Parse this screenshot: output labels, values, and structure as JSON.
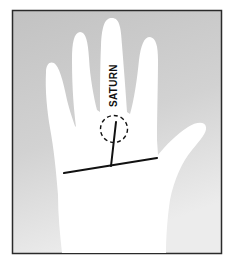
{
  "diagram": {
    "labels": [
      {
        "text": "SATURN",
        "target": "middle-finger"
      }
    ],
    "marker": {
      "type": "dashed-circle",
      "location": "base-of-middle-finger"
    },
    "lines": [
      {
        "name": "heart-line"
      },
      {
        "name": "branch-line-to-saturn"
      }
    ]
  },
  "colors": {
    "background": "#c8c8c8",
    "hand": "#ffffff",
    "frame": "#2a2a2a",
    "lines": "#111111"
  }
}
